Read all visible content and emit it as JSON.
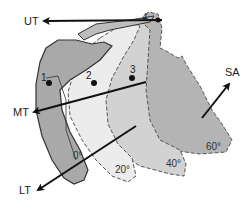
{
  "diagram": {
    "vectors": [
      {
        "id": "ut",
        "label": "UT"
      },
      {
        "id": "mt",
        "label": "MT"
      },
      {
        "id": "lt",
        "label": "LT"
      },
      {
        "id": "sa",
        "label": "SA"
      }
    ],
    "positions": [
      {
        "id": "p0",
        "label": "0°"
      },
      {
        "id": "p20",
        "label": "20°"
      },
      {
        "id": "p40",
        "label": "40°"
      },
      {
        "id": "p60",
        "label": "60°"
      }
    ],
    "points": [
      {
        "id": "pt1",
        "label": "1"
      },
      {
        "id": "pt2",
        "label": "2"
      },
      {
        "id": "pt3",
        "label": "3"
      },
      {
        "id": "pt4",
        "label": "4"
      }
    ],
    "colors": {
      "shape_0": "#a9a9a9",
      "shape_20": "#e6e6e6",
      "shape_40": "#cfcfcf",
      "shape_60": "#b4b4b4",
      "acromion": "#bdbdbd",
      "outline_dash": "#555555",
      "arrow": "#111111"
    }
  }
}
